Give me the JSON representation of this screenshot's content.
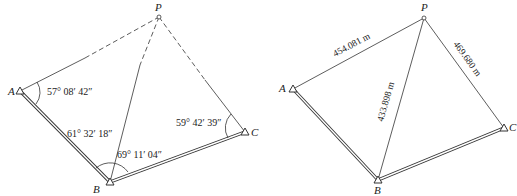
{
  "left_figure": {
    "points": {
      "A": {
        "label": "A",
        "x": 20,
        "y": 91
      },
      "B": {
        "label": "B",
        "x": 110,
        "y": 182
      },
      "C": {
        "label": "C",
        "x": 245,
        "y": 132
      },
      "P": {
        "label": "P",
        "x": 159,
        "y": 17
      }
    },
    "angles": {
      "at_A": "57° 08′ 42″",
      "A_B_side": "61° 32′ 18″",
      "at_B": "69° 11′ 04″",
      "at_C": "59° 42′ 39″"
    },
    "line_colors": {
      "stroke": "#333333"
    }
  },
  "right_figure": {
    "points": {
      "A": {
        "label": "A",
        "x": 293,
        "y": 89
      },
      "B": {
        "label": "B",
        "x": 378,
        "y": 180
      },
      "C": {
        "label": "C",
        "x": 504,
        "y": 128
      },
      "P": {
        "label": "P",
        "x": 424,
        "y": 18
      }
    },
    "distances": {
      "PA": "454.081 m",
      "PB": "433.898 m",
      "PC": "469.680 m"
    }
  }
}
